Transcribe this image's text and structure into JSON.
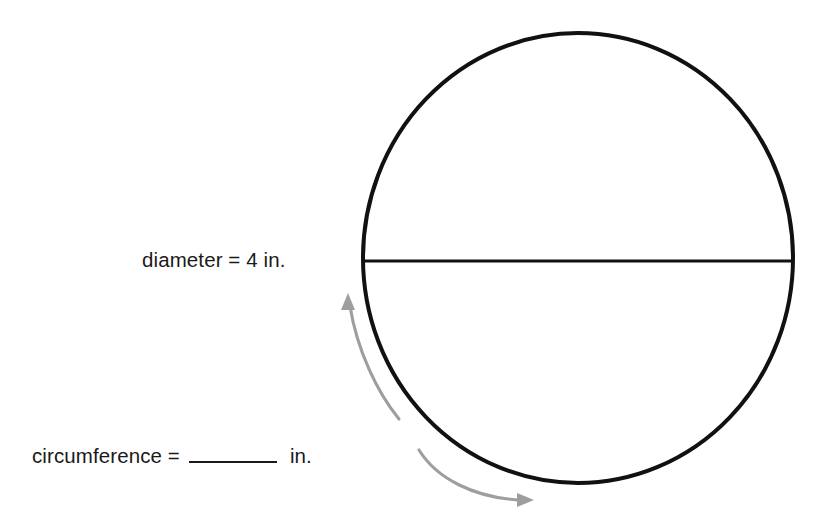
{
  "figure": {
    "type": "geometry-diagram",
    "shape": "circle",
    "colors": {
      "stroke": "#111111",
      "arrow": "#9e9e9e",
      "text": "#1a1a1a",
      "background": "#ffffff"
    },
    "circle": {
      "center_x": 578,
      "center_y": 258,
      "radius_x": 215,
      "radius_y": 225,
      "stroke_width": 4
    },
    "diameter_line": {
      "x1": 363,
      "x2": 793,
      "y": 261,
      "stroke_width": 3.2
    },
    "arrows": [
      {
        "name": "upper-circumference-arrow",
        "direction": "counterclockwise-up",
        "head_x": 347,
        "head_y": 296
      },
      {
        "name": "lower-circumference-arrow",
        "direction": "clockwise-down-right",
        "head_x": 533,
        "head_y": 500
      }
    ]
  },
  "labels": {
    "diameter": {
      "text": "diameter = 4 in.",
      "value": "4",
      "unit": "in."
    },
    "circumference": {
      "prefix": "circumference =",
      "answer": "",
      "unit": "in."
    }
  }
}
